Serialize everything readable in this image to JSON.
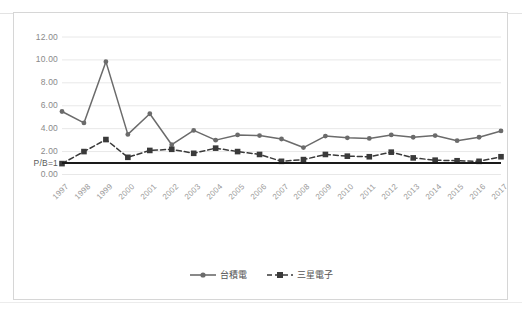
{
  "chart_data": {
    "type": "line",
    "title": "",
    "xlabel": "",
    "ylabel": "",
    "ylim": [
      0,
      12
    ],
    "ytick_step": 2,
    "grid": true,
    "legend_position": "bottom",
    "categories": [
      "1997",
      "1998",
      "1999",
      "2000",
      "2001",
      "2002",
      "2003",
      "2004",
      "2005",
      "2006",
      "2007",
      "2008",
      "2009",
      "2010",
      "2011",
      "2012",
      "2013",
      "2014",
      "2015",
      "2016",
      "2017"
    ],
    "ytick_labels": [
      "0.00",
      "2.00",
      "4.00",
      "6.00",
      "8.00",
      "10.00",
      "12.00"
    ],
    "reference_line": {
      "label": "P/B=1",
      "value": 1.0,
      "color": "#1a1a1a"
    },
    "series": [
      {
        "name": "台積電",
        "color": "#6b6b6b",
        "marker": "circle",
        "line_style": "solid",
        "values": [
          5.5,
          4.5,
          9.85,
          3.5,
          5.3,
          2.6,
          3.85,
          3.0,
          3.45,
          3.4,
          3.1,
          2.35,
          3.35,
          3.2,
          3.15,
          3.45,
          3.25,
          3.4,
          2.95,
          3.25,
          3.8
        ]
      },
      {
        "name": "三星電子",
        "color": "#3a3a3a",
        "marker": "square",
        "line_style": "dashed",
        "values": [
          0.95,
          2.0,
          3.05,
          1.5,
          2.1,
          2.2,
          1.85,
          2.3,
          2.0,
          1.75,
          1.15,
          1.3,
          1.75,
          1.6,
          1.55,
          1.95,
          1.45,
          1.25,
          1.2,
          1.15,
          1.55
        ]
      }
    ]
  },
  "legend": {
    "items": [
      {
        "label": "台積電"
      },
      {
        "label": "三星電子"
      }
    ]
  }
}
